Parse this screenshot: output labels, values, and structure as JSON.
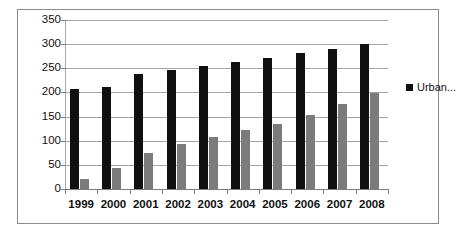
{
  "chart_data": {
    "type": "bar",
    "title": "",
    "xlabel": "",
    "ylabel": "",
    "categories": [
      "1999",
      "2000",
      "2001",
      "2002",
      "2003",
      "2004",
      "2005",
      "2006",
      "2007",
      "2008"
    ],
    "series": [
      {
        "name": "Urban...",
        "color": "#101010",
        "values": [
          208,
          211,
          238,
          246,
          254,
          264,
          271,
          281,
          291,
          300
        ]
      },
      {
        "name": "",
        "color": "#7b7b7b",
        "values": [
          20,
          43,
          75,
          93,
          107,
          122,
          135,
          154,
          177,
          198
        ]
      }
    ],
    "ylim": [
      0,
      350
    ],
    "yticks": [
      0,
      50,
      100,
      150,
      200,
      250,
      300,
      350
    ],
    "ytick_labels": [
      "0",
      "50",
      "100",
      "150",
      "200",
      "250",
      "300",
      "350"
    ],
    "grid": true,
    "grid_color": "#a6a6a6",
    "legend": {
      "position": "right",
      "entries": [
        {
          "label": "Urban...",
          "color": "#101010"
        }
      ]
    },
    "frame": true,
    "frame_color": "#8c8c8c",
    "background": "#ffffff"
  }
}
